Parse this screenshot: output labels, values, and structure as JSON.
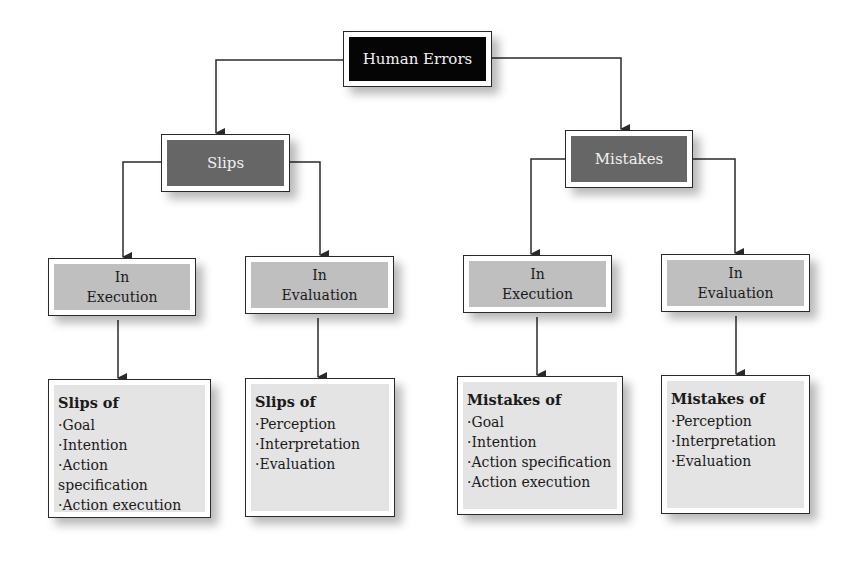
{
  "root": {
    "label": "Human Errors"
  },
  "branches": [
    {
      "label": "Slips",
      "children": [
        {
          "label_line1": "In",
          "label_line2": "Execution",
          "leaf": {
            "title": "Slips of",
            "items": [
              "Goal",
              "Intention",
              "Action specification",
              "Action execution"
            ]
          }
        },
        {
          "label_line1": "In",
          "label_line2": "Evaluation",
          "leaf": {
            "title": "Slips of",
            "items": [
              "Perception",
              "Interpretation",
              "Evaluation"
            ]
          }
        }
      ]
    },
    {
      "label": "Mistakes",
      "children": [
        {
          "label_line1": "In",
          "label_line2": "Execution",
          "leaf": {
            "title": "Mistakes of",
            "items": [
              "Goal",
              "Intention",
              "Action specification",
              "Action execution"
            ]
          }
        },
        {
          "label_line1": "In",
          "label_line2": "Evaluation",
          "leaf": {
            "title": "Mistakes of",
            "items": [
              "Perception",
              "Interpretation",
              "Evaluation"
            ]
          }
        }
      ]
    }
  ],
  "colors": {
    "root_fill": "#050505",
    "branch_fill": "#666666",
    "mode_fill": "#bfbfbf",
    "leaf_fill": "#e4e4e4",
    "line": "#2a2a2a"
  }
}
